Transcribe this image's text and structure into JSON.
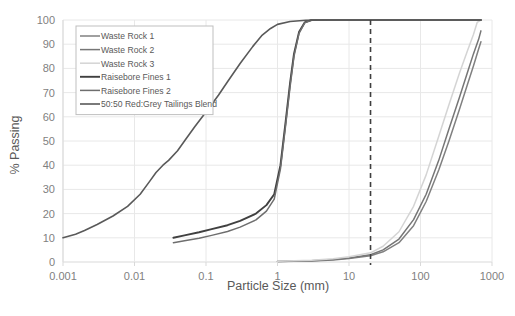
{
  "chart_data": {
    "type": "line",
    "title": "",
    "xlabel": "Particle Size (mm)",
    "ylabel": "% Passing",
    "xscale": "log",
    "xlim": [
      0.001,
      1000
    ],
    "ylim": [
      0,
      100
    ],
    "xticks": [
      "0.001",
      "0.01",
      "0.1",
      "1",
      "10",
      "100",
      "1000"
    ],
    "yticks": [
      "0",
      "10",
      "20",
      "30",
      "40",
      "50",
      "60",
      "70",
      "80",
      "90",
      "100"
    ],
    "grid": true,
    "legend_position": "upper-left",
    "annotations": [
      {
        "name": "reference-line",
        "type": "vertical-dashed",
        "x": 20,
        "color": "#3f3f3f"
      }
    ],
    "series": [
      {
        "name": "Waste Rock 1",
        "color": "#808080",
        "width": 1.5,
        "points": [
          [
            1,
            0.2
          ],
          [
            3,
            0.4
          ],
          [
            6,
            0.8
          ],
          [
            10,
            1.4
          ],
          [
            20,
            2.6
          ],
          [
            30,
            4.2
          ],
          [
            50,
            8.0
          ],
          [
            80,
            15.0
          ],
          [
            120,
            25.0
          ],
          [
            180,
            38.0
          ],
          [
            250,
            50.0
          ],
          [
            350,
            63.0
          ],
          [
            450,
            73.0
          ],
          [
            550,
            81.0
          ],
          [
            650,
            88.0
          ],
          [
            700,
            91.0
          ]
        ]
      },
      {
        "name": "Waste Rock 2",
        "color": "#767676",
        "width": 1.5,
        "points": [
          [
            1,
            0.2
          ],
          [
            3,
            0.5
          ],
          [
            6,
            1.0
          ],
          [
            10,
            1.7
          ],
          [
            20,
            3.0
          ],
          [
            30,
            5.0
          ],
          [
            50,
            9.5
          ],
          [
            80,
            17.5
          ],
          [
            120,
            28.0
          ],
          [
            180,
            42.0
          ],
          [
            250,
            55.0
          ],
          [
            350,
            68.0
          ],
          [
            450,
            78.0
          ],
          [
            550,
            86.0
          ],
          [
            650,
            92.0
          ],
          [
            700,
            95.5
          ]
        ]
      },
      {
        "name": "Waste Rock 3",
        "color": "#d4d4d4",
        "width": 1.5,
        "points": [
          [
            1,
            0.3
          ],
          [
            3,
            0.7
          ],
          [
            6,
            1.3
          ],
          [
            10,
            2.2
          ],
          [
            20,
            3.8
          ],
          [
            30,
            6.5
          ],
          [
            50,
            12.5
          ],
          [
            80,
            23.0
          ],
          [
            120,
            36.0
          ],
          [
            180,
            52.0
          ],
          [
            250,
            65.0
          ],
          [
            350,
            78.0
          ],
          [
            450,
            87.0
          ],
          [
            550,
            94.0
          ],
          [
            620,
            99.0
          ],
          [
            700,
            100.0
          ]
        ]
      },
      {
        "name": "Raisebore Fines 1",
        "color": "#404040",
        "width": 1.9,
        "points": [
          [
            0.035,
            10.0
          ],
          [
            0.05,
            11.0
          ],
          [
            0.08,
            12.3
          ],
          [
            0.12,
            13.6
          ],
          [
            0.2,
            15.2
          ],
          [
            0.3,
            17.0
          ],
          [
            0.5,
            20.0
          ],
          [
            0.7,
            23.5
          ],
          [
            0.9,
            28.0
          ],
          [
            1.1,
            40.0
          ],
          [
            1.3,
            58.0
          ],
          [
            1.5,
            74.0
          ],
          [
            1.7,
            86.0
          ],
          [
            2.0,
            95.0
          ],
          [
            2.4,
            99.0
          ],
          [
            3.0,
            100.0
          ],
          [
            10,
            100.0
          ],
          [
            50,
            100.0
          ],
          [
            200,
            100.0
          ],
          [
            700,
            100.0
          ]
        ]
      },
      {
        "name": "Raisebore Fines 2",
        "color": "#6e6e6e",
        "width": 1.5,
        "points": [
          [
            0.035,
            8.0
          ],
          [
            0.05,
            8.8
          ],
          [
            0.08,
            9.8
          ],
          [
            0.12,
            11.0
          ],
          [
            0.2,
            12.6
          ],
          [
            0.3,
            14.4
          ],
          [
            0.5,
            17.4
          ],
          [
            0.7,
            21.0
          ],
          [
            0.9,
            26.0
          ],
          [
            1.1,
            38.5
          ],
          [
            1.3,
            56.5
          ],
          [
            1.5,
            72.5
          ],
          [
            1.7,
            85.0
          ],
          [
            2.0,
            94.5
          ],
          [
            2.4,
            98.8
          ],
          [
            3.0,
            100.0
          ],
          [
            10,
            100.0
          ],
          [
            50,
            100.0
          ],
          [
            200,
            100.0
          ],
          [
            700,
            100.0
          ]
        ]
      },
      {
        "name": "50:50 Red:Grey Tailings Blend",
        "color": "#595959",
        "width": 1.6,
        "points": [
          [
            0.001,
            10.0
          ],
          [
            0.0015,
            11.5
          ],
          [
            0.002,
            13.0
          ],
          [
            0.003,
            15.5
          ],
          [
            0.005,
            19.0
          ],
          [
            0.008,
            23.0
          ],
          [
            0.012,
            28.0
          ],
          [
            0.016,
            33.0
          ],
          [
            0.02,
            37.0
          ],
          [
            0.025,
            40.0
          ],
          [
            0.03,
            42.0
          ],
          [
            0.04,
            46.0
          ],
          [
            0.05,
            50.0
          ],
          [
            0.07,
            56.0
          ],
          [
            0.1,
            62.0
          ],
          [
            0.15,
            69.0
          ],
          [
            0.2,
            74.5
          ],
          [
            0.3,
            82.0
          ],
          [
            0.45,
            89.0
          ],
          [
            0.6,
            93.5
          ],
          [
            0.8,
            96.5
          ],
          [
            1.0,
            98.2
          ],
          [
            1.5,
            99.4
          ],
          [
            2.5,
            99.9
          ],
          [
            5,
            100.0
          ],
          [
            20,
            100.0
          ],
          [
            100,
            100.0
          ],
          [
            700,
            100.0
          ]
        ]
      }
    ]
  },
  "legend": {
    "entries": [
      {
        "label": "Waste Rock 1"
      },
      {
        "label": "Waste Rock 2"
      },
      {
        "label": "Waste Rock 3"
      },
      {
        "label": "Raisebore Fines 1"
      },
      {
        "label": "Raisebore Fines 2"
      },
      {
        "label": "50:50 Red:Grey Tailings Blend"
      }
    ]
  }
}
